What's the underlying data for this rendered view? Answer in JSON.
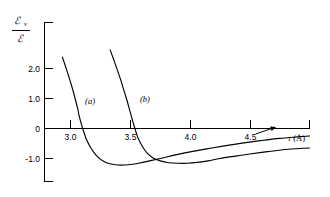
{
  "chart_data": {
    "type": "line",
    "title": "",
    "subtitle": "",
    "xlabel": "r (Å)",
    "ylabel": "ℰ_v / ℰ",
    "ylabel_numerator_symbol": "ℰ",
    "ylabel_numerator_subscript": "v",
    "ylabel_denominator_symbol": "ℰ",
    "xlim": [
      2.78,
      5.0
    ],
    "ylim": [
      -1.85,
      3.35
    ],
    "grid": false,
    "legend_position": "inline-curve-labels",
    "x_ticks": [
      3.0,
      3.5,
      4.0,
      4.5
    ],
    "x_tick_labels": [
      "3.0",
      "3.5",
      "4.0",
      "4.5"
    ],
    "x_extra_tick_unlabeled": 5.0,
    "y_ticks": [
      -1.0,
      0,
      1.0,
      2.0,
      3.0
    ],
    "y_tick_labels": [
      "-1.0",
      "0",
      "1.0",
      "2.0",
      ""
    ],
    "y_labeled_ticks": [
      "-1.0",
      "0",
      "1.0",
      "2.0"
    ],
    "annotations": [
      {
        "name": "arrow-to-curve-a",
        "text": "",
        "x": 4.55,
        "y": -0.18,
        "points_to_x": 4.72,
        "points_to_y": 0.05
      }
    ],
    "series": [
      {
        "name": "(a)",
        "label": "(a)",
        "label_x": 3.12,
        "label_y": 0.82,
        "color": "#000000",
        "zero_crossing_x": 3.07,
        "minimum_x": 3.42,
        "minimum_y": -1.22,
        "points": [
          [
            2.93,
            2.38
          ],
          [
            2.96,
            2.02
          ],
          [
            3.0,
            1.52
          ],
          [
            3.03,
            1.1
          ],
          [
            3.06,
            0.63
          ],
          [
            3.07,
            0.42
          ],
          [
            3.1,
            0.0
          ],
          [
            3.13,
            -0.35
          ],
          [
            3.17,
            -0.66
          ],
          [
            3.21,
            -0.88
          ],
          [
            3.25,
            -1.03
          ],
          [
            3.3,
            -1.14
          ],
          [
            3.36,
            -1.2
          ],
          [
            3.42,
            -1.22
          ],
          [
            3.5,
            -1.2
          ],
          [
            3.58,
            -1.15
          ],
          [
            3.66,
            -1.08
          ],
          [
            3.76,
            -0.99
          ],
          [
            3.88,
            -0.88
          ],
          [
            4.0,
            -0.78
          ],
          [
            4.15,
            -0.67
          ],
          [
            4.3,
            -0.57
          ],
          [
            4.45,
            -0.48
          ],
          [
            4.6,
            -0.4
          ],
          [
            4.75,
            -0.33
          ],
          [
            4.9,
            -0.28
          ],
          [
            5.0,
            -0.25
          ]
        ]
      },
      {
        "name": "(b)",
        "label": "(b)",
        "label_x": 3.58,
        "label_y": 0.9,
        "color": "#000000",
        "zero_crossing_x": 3.53,
        "minimum_x": 3.95,
        "minimum_y": -1.16,
        "points": [
          [
            3.33,
            2.62
          ],
          [
            3.37,
            2.18
          ],
          [
            3.41,
            1.72
          ],
          [
            3.44,
            1.34
          ],
          [
            3.47,
            0.95
          ],
          [
            3.5,
            0.52
          ],
          [
            3.53,
            0.1
          ],
          [
            3.56,
            -0.28
          ],
          [
            3.6,
            -0.6
          ],
          [
            3.64,
            -0.82
          ],
          [
            3.69,
            -0.98
          ],
          [
            3.75,
            -1.08
          ],
          [
            3.82,
            -1.14
          ],
          [
            3.9,
            -1.16
          ],
          [
            3.98,
            -1.16
          ],
          [
            4.06,
            -1.13
          ],
          [
            4.15,
            -1.08
          ],
          [
            4.25,
            -1.0
          ],
          [
            4.38,
            -0.92
          ],
          [
            4.5,
            -0.85
          ],
          [
            4.65,
            -0.77
          ],
          [
            4.8,
            -0.7
          ],
          [
            4.95,
            -0.66
          ],
          [
            5.0,
            -0.65
          ]
        ]
      }
    ]
  }
}
